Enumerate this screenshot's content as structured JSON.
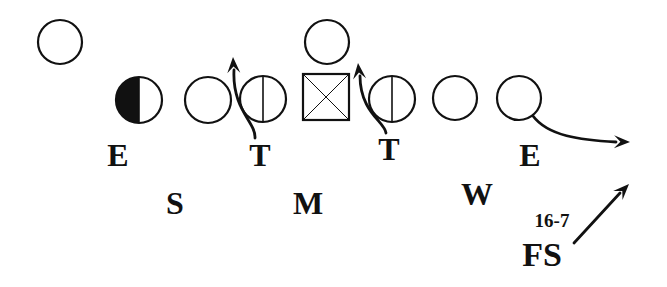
{
  "figure": {
    "title": "",
    "figure_number": "16-7",
    "colors": {
      "ink": "#111111",
      "background": "#ffffff"
    }
  },
  "offense": {
    "players": [
      {
        "id": "wide-receiver",
        "shape": "circle",
        "cx": 60,
        "cy": 42,
        "r": 22
      },
      {
        "id": "tight-end",
        "shape": "half-filled-circle",
        "cx": 139,
        "cy": 100,
        "r": 23
      },
      {
        "id": "left-tackle",
        "shape": "circle",
        "cx": 208,
        "cy": 100,
        "r": 23
      },
      {
        "id": "left-guard",
        "shape": "split-circle",
        "cx": 263,
        "cy": 99,
        "r": 23
      },
      {
        "id": "center",
        "shape": "x-square",
        "x": 303,
        "y": 74,
        "size": 46
      },
      {
        "id": "quarterback",
        "shape": "circle",
        "cx": 327,
        "cy": 42,
        "r": 22
      },
      {
        "id": "right-guard",
        "shape": "split-circle",
        "cx": 392,
        "cy": 99,
        "r": 23
      },
      {
        "id": "right-tackle",
        "shape": "circle",
        "cx": 455,
        "cy": 98,
        "r": 22
      },
      {
        "id": "split-end",
        "shape": "circle",
        "cx": 519,
        "cy": 98,
        "r": 22
      }
    ]
  },
  "defense": {
    "labels": [
      {
        "id": "left-end",
        "text": "E",
        "x": 118,
        "y": 166,
        "size": 32
      },
      {
        "id": "left-tackle",
        "text": "T",
        "x": 260,
        "y": 166,
        "size": 32
      },
      {
        "id": "right-tackle",
        "text": "T",
        "x": 389,
        "y": 160,
        "size": 32
      },
      {
        "id": "right-end",
        "text": "E",
        "x": 530,
        "y": 166,
        "size": 32
      },
      {
        "id": "strong-linebacker",
        "text": "S",
        "x": 175,
        "y": 214,
        "size": 32
      },
      {
        "id": "middle-linebacker",
        "text": "M",
        "x": 308,
        "y": 214,
        "size": 32
      },
      {
        "id": "weak-linebacker",
        "text": "W",
        "x": 477,
        "y": 205,
        "size": 32
      },
      {
        "id": "free-safety",
        "text": "FS",
        "x": 542,
        "y": 266,
        "size": 34
      }
    ],
    "figure_label": {
      "text": "16-7",
      "x": 552,
      "y": 227,
      "size": 19
    }
  },
  "routes": [
    {
      "id": "left-tackle-stunt",
      "path": "M255,138 C256,122 232,110 234,70",
      "tip": [
        233,
        57
      ],
      "dir": [
        -0.05,
        -1
      ]
    },
    {
      "id": "right-tackle-stunt",
      "path": "M386,133 C385,122 360,112 360,76",
      "tip": [
        358,
        63
      ],
      "dir": [
        -0.1,
        -1
      ]
    },
    {
      "id": "end-drop",
      "path": "M533,116 C548,136 580,140 616,142",
      "tip": [
        630,
        142
      ],
      "dir": [
        1,
        0.02
      ]
    },
    {
      "id": "free-safety-move",
      "path": "M574,243 L620,193",
      "tip": [
        629,
        184
      ],
      "dir": [
        0.7,
        -0.72
      ]
    }
  ]
}
